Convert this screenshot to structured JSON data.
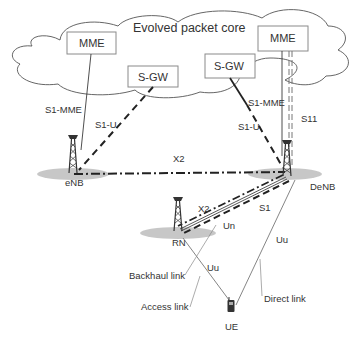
{
  "diagram": {
    "cloud_label": "Evolved packet core",
    "nodes": {
      "mme_left": "MME",
      "sgw_left": "S-GW",
      "sgw_right": "S-GW",
      "mme_right": "MME",
      "enb": "eNB",
      "denb": "DeNB",
      "rn": "RN",
      "ue": "UE"
    },
    "interfaces": {
      "s1_mme_left": "S1-MME",
      "s1_u_left": "S1-U",
      "s1_mme_right": "S1-MME",
      "s1_u_right": "S1-U",
      "s11": "S11",
      "x2_top": "X2",
      "x2_rn": "X2",
      "s1_rn": "S1",
      "un": "Un",
      "uu_rn": "Uu",
      "uu_denb": "Uu"
    },
    "link_legend": {
      "backhaul": "Backhaul link",
      "access": "Access link",
      "direct": "Direct link"
    },
    "colors": {
      "line": "#222222",
      "thin_line": "#777777",
      "box_border": "#8a8a8a",
      "cell_fill": "#bdbdbd",
      "text": "#333333"
    }
  }
}
